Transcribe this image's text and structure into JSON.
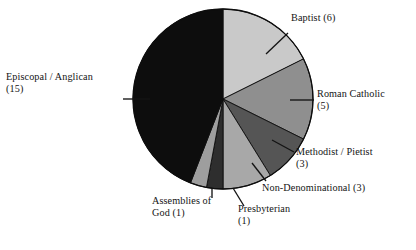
{
  "chart_data": {
    "type": "pie",
    "title": "",
    "subtitle": "",
    "xlabel": "",
    "ylabel": "",
    "legend_position": "none",
    "grid": false,
    "total": 34,
    "labels_include_counts": true,
    "start_angle_deg": 0,
    "direction": "clockwise",
    "categories": [
      "Episcopal / Anglican",
      "Baptist",
      "Roman Catholic",
      "Methodist / Pietist",
      "Non-Denominational",
      "Presbyterian",
      "Assemblies of God"
    ],
    "values": [
      15,
      6,
      5,
      3,
      3,
      1,
      1
    ],
    "colors": [
      "#0d0d0d",
      "#c9c9c9",
      "#8f8f8f",
      "#555555",
      "#a8a8a8",
      "#2e2e2e",
      "#9e9e9e"
    ],
    "slices": [
      {
        "name": "Baptist",
        "value": 6,
        "color": "#c9c9c9",
        "label": "Baptist (6)"
      },
      {
        "name": "Roman Catholic",
        "value": 5,
        "color": "#8f8f8f",
        "label": "Roman Catholic (5)"
      },
      {
        "name": "Methodist / Pietist",
        "value": 3,
        "color": "#555555",
        "label": "Methodist / Pietist (3)"
      },
      {
        "name": "Non-Denominational",
        "value": 3,
        "color": "#a8a8a8",
        "label": "Non-Denominational (3)"
      },
      {
        "name": "Presbyterian",
        "value": 1,
        "color": "#2e2e2e",
        "label": "Presbyterian (1)"
      },
      {
        "name": "Assemblies of God",
        "value": 1,
        "color": "#9e9e9e",
        "label": "Assemblies of God (1)"
      },
      {
        "name": "Episcopal / Anglican",
        "value": 15,
        "color": "#0d0d0d",
        "label": "Episcopal / Anglican (15)"
      }
    ]
  },
  "labels": {
    "episcopal": {
      "line1": "Episcopal / Anglican",
      "line2": "(15)"
    },
    "baptist": {
      "line1": "Baptist (6)",
      "line2": ""
    },
    "roman_catholic": {
      "line1": "Roman Catholic",
      "line2": "(5)"
    },
    "methodist": {
      "line1": "Methodist / Pietist",
      "line2": "(3)"
    },
    "non_denominational": {
      "line1": "Non-Denominational (3)",
      "line2": ""
    },
    "presbyterian": {
      "line1": "Presbyterian",
      "line2": "(1)"
    },
    "assemblies_of_god": {
      "line1": "Assemblies of",
      "line2": "God (1)"
    }
  },
  "style": {
    "background": "#ffffff",
    "outline": "#0d0d0d",
    "leader_line": "#141414",
    "text": "#141414"
  }
}
